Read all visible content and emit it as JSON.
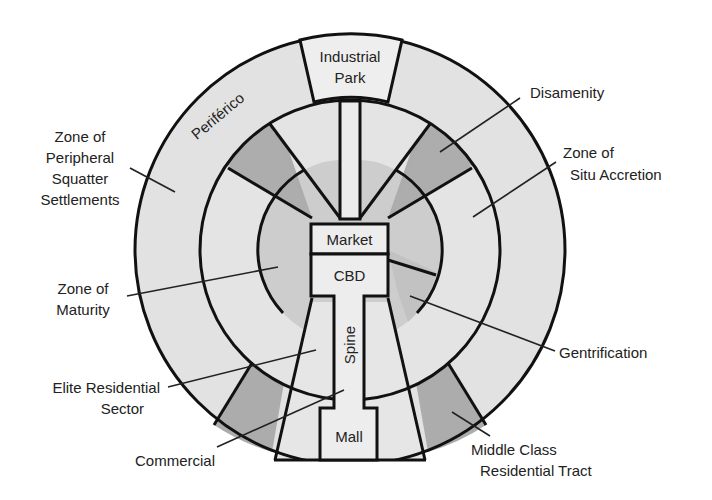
{
  "diagram": {
    "colors": {
      "light": "#e2e2e2",
      "medium": "#cfcfcf",
      "dark": "#acacac",
      "core": "#ededed",
      "line": "#111111"
    },
    "center_labels": {
      "industrial_park_line1": "Industrial",
      "industrial_park_line2": "Park",
      "market": "Market",
      "cbd": "CBD",
      "spine": "Spine",
      "mall": "Mall",
      "periferico": "Periférico"
    },
    "callouts": {
      "peripheral": [
        "Zone of",
        "Peripheral",
        "Squatter",
        "Settlements"
      ],
      "maturity": [
        "Zone of",
        "Maturity"
      ],
      "elite": [
        "Elite Residential",
        "Sector"
      ],
      "commercial": [
        "Commercial"
      ],
      "disamenity": [
        "Disamenity"
      ],
      "situ": [
        "Zone of",
        "Situ Accretion"
      ],
      "gentrification": [
        "Gentrification"
      ],
      "middle_class": [
        "Middle Class",
        "Residential Tract"
      ]
    }
  }
}
